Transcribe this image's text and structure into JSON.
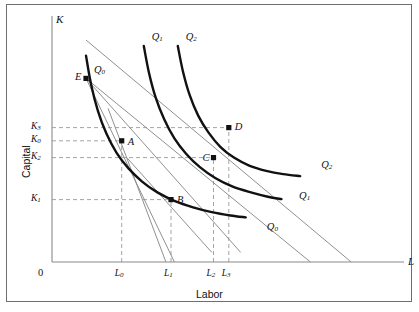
{
  "figure": {
    "axis_titles": {
      "y": "Capital",
      "x": "Labor"
    },
    "axis_symbols": {
      "y": "K",
      "x": "L"
    },
    "origin_label": "0"
  },
  "chart_data": {
    "type": "line",
    "title": "",
    "xlabel": "Labor",
    "ylabel": "Capital",
    "xlim": [
      0,
      100
    ],
    "ylim": [
      0,
      100
    ],
    "grid": false,
    "legend_position": "inline-curve-labels",
    "y_ticks": [
      {
        "label": "K",
        "sub": "3",
        "value": 56.0
      },
      {
        "label": "K",
        "sub": "0",
        "value": 50.5
      },
      {
        "label": "K",
        "sub": "2",
        "value": 43.5
      },
      {
        "label": "K",
        "sub": "1",
        "value": 26.0
      }
    ],
    "x_ticks": [
      {
        "label": "L",
        "sub": "0",
        "value": 20.5
      },
      {
        "label": "L",
        "sub": "1",
        "value": 35.0
      },
      {
        "label": "L",
        "sub": "2",
        "value": 47.5
      },
      {
        "label": "L",
        "sub": "3",
        "value": 52.0
      }
    ],
    "series": [
      {
        "name": "Q0",
        "label": "Q",
        "sub": "0",
        "kind": "isoquant",
        "style": "thick-black",
        "top_label_pos": {
          "x": 13.5,
          "y": 79.5
        },
        "right_label_pos": {
          "x": 62.0,
          "y": 14.0
        },
        "points": [
          [
            10.0,
            86.0
          ],
          [
            11.5,
            74.0
          ],
          [
            13.5,
            63.0
          ],
          [
            16.0,
            53.5
          ],
          [
            19.0,
            45.5
          ],
          [
            22.5,
            39.0
          ],
          [
            26.5,
            33.5
          ],
          [
            31.0,
            29.0
          ],
          [
            36.0,
            25.5
          ],
          [
            41.5,
            22.8
          ],
          [
            47.0,
            20.8
          ],
          [
            52.5,
            19.4
          ],
          [
            57.0,
            18.6
          ]
        ]
      },
      {
        "name": "Q1",
        "label": "Q",
        "sub": "1",
        "kind": "isoquant",
        "style": "thick-black",
        "top_label_pos": {
          "x": 30.5,
          "y": 93.5
        },
        "right_label_pos": {
          "x": 71.5,
          "y": 27.0
        },
        "points": [
          [
            27.0,
            90.0
          ],
          [
            28.5,
            79.0
          ],
          [
            30.5,
            68.5
          ],
          [
            33.0,
            59.5
          ],
          [
            36.0,
            51.5
          ],
          [
            39.5,
            45.0
          ],
          [
            43.5,
            39.5
          ],
          [
            48.0,
            35.0
          ],
          [
            53.0,
            31.5
          ],
          [
            58.5,
            29.0
          ],
          [
            63.5,
            27.2
          ],
          [
            67.5,
            26.2
          ]
        ]
      },
      {
        "name": "Q2",
        "label": "Q",
        "sub": "2",
        "kind": "isoquant",
        "style": "thick-black",
        "top_label_pos": {
          "x": 40.5,
          "y": 93.5
        },
        "right_label_pos": {
          "x": 78.0,
          "y": 40.0
        },
        "points": [
          [
            37.0,
            90.0
          ],
          [
            38.5,
            79.5
          ],
          [
            40.5,
            69.5
          ],
          [
            43.0,
            61.0
          ],
          [
            46.0,
            54.0
          ],
          [
            49.5,
            48.0
          ],
          [
            53.5,
            43.5
          ],
          [
            58.0,
            40.2
          ],
          [
            63.0,
            38.0
          ],
          [
            68.0,
            36.6
          ],
          [
            73.0,
            35.8
          ]
        ]
      }
    ],
    "isocost_lines": [
      {
        "name": "isocost-upper",
        "style": "thin-gray",
        "from": [
          10.0,
          92.5
        ],
        "to": [
          88.0,
          0.0
        ]
      },
      {
        "name": "isocost-lower",
        "style": "thin-gray",
        "from": [
          10.0,
          76.5
        ],
        "to": [
          76.0,
          0.0
        ]
      },
      {
        "name": "ray-from-E-steep",
        "style": "thin-gray",
        "from": [
          10.0,
          76.5
        ],
        "to": [
          36.0,
          0.0
        ]
      },
      {
        "name": "ray-from-E-shallow",
        "style": "thin-gray",
        "from": [
          10.0,
          76.5
        ],
        "to": [
          55.5,
          4.0
        ]
      },
      {
        "name": "tangent-at-A",
        "style": "thin-gray",
        "from": [
          16.5,
          64.0
        ],
        "to": [
          33.5,
          0.0
        ]
      },
      {
        "name": "tangent-at-B",
        "style": "thin-gray",
        "from": [
          22.0,
          43.5
        ],
        "to": [
          47.0,
          4.0
        ]
      }
    ],
    "points": [
      {
        "name": "E",
        "label": "E",
        "x": 10.0,
        "y": 76.5,
        "label_side": "left"
      },
      {
        "name": "A",
        "label": "A",
        "x": 20.5,
        "y": 50.5,
        "label_side": "right"
      },
      {
        "name": "B",
        "label": "B",
        "x": 35.0,
        "y": 26.0,
        "label_side": "right"
      },
      {
        "name": "C",
        "label": "C",
        "x": 47.5,
        "y": 43.5,
        "label_side": "left"
      },
      {
        "name": "D",
        "label": "D",
        "x": 52.0,
        "y": 56.0,
        "label_side": "right"
      }
    ],
    "dashed_guides": [
      {
        "name": "guide-K3",
        "orientation": "horizontal",
        "value": 56.0,
        "from": 0,
        "to": 52.0
      },
      {
        "name": "guide-K0",
        "orientation": "horizontal",
        "value": 50.5,
        "from": 0,
        "to": 20.5
      },
      {
        "name": "guide-K2",
        "orientation": "horizontal",
        "value": 43.5,
        "from": 0,
        "to": 47.5
      },
      {
        "name": "guide-K1",
        "orientation": "horizontal",
        "value": 26.0,
        "from": 0,
        "to": 35.0
      },
      {
        "name": "guide-L0",
        "orientation": "vertical",
        "value": 20.5,
        "from": 0,
        "to": 50.5
      },
      {
        "name": "guide-L1",
        "orientation": "vertical",
        "value": 35.0,
        "from": 0,
        "to": 26.0
      },
      {
        "name": "guide-L2",
        "orientation": "vertical",
        "value": 47.5,
        "from": 0,
        "to": 43.5
      },
      {
        "name": "guide-L3",
        "orientation": "vertical",
        "value": 52.0,
        "from": 0,
        "to": 56.0
      }
    ],
    "colors": {
      "curve": "#111111",
      "line": "#8a8a8a",
      "axis": "#8a8a8a",
      "dash": "#9a9a9a",
      "text": "#111111",
      "frame": "#6f6f6f"
    }
  }
}
